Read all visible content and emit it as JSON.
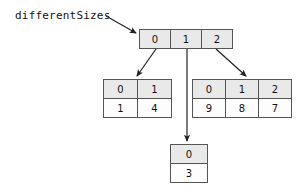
{
  "diagram": {
    "title_label": "differentSizes",
    "stroke_color": "#555555",
    "index_fill": "#e9e9e9",
    "value_fill": "#fdfdfd",
    "arrow_color": "#222222"
  },
  "root_array": {
    "name": "differentSizes",
    "indices": [
      "0",
      "1",
      "2"
    ]
  },
  "sub_arrays": [
    {
      "parent_index": "0",
      "position": "left",
      "indices": [
        "0",
        "1"
      ],
      "values": [
        "1",
        "4"
      ]
    },
    {
      "parent_index": "1",
      "position": "bottom",
      "indices": [
        "0"
      ],
      "values": [
        "3"
      ]
    },
    {
      "parent_index": "2",
      "position": "right",
      "indices": [
        "0",
        "1",
        "2"
      ],
      "values": [
        "9",
        "8",
        "7"
      ]
    }
  ],
  "arrows": [
    {
      "name": "label-to-root",
      "from": "differentSizes",
      "to": "root_array"
    },
    {
      "name": "root0-to-left",
      "from": "0",
      "to": "left_sub_array"
    },
    {
      "name": "root1-to-bottom",
      "from": "1",
      "to": "bottom_sub_array"
    },
    {
      "name": "root2-to-right",
      "from": "2",
      "to": "right_sub_array"
    }
  ]
}
